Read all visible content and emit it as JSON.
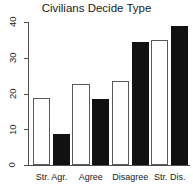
{
  "chart_data": {
    "type": "bar",
    "title": "Civilians Decide Type",
    "xlabel": "",
    "ylabel": "",
    "categories": [
      "Str. Agr.",
      "Agree",
      "Disagree",
      "Str. Dis."
    ],
    "series": [
      {
        "name": "open",
        "style": "white",
        "values": [
          18.7,
          22.8,
          23.6,
          35.0
        ]
      },
      {
        "name": "filled",
        "style": "black",
        "values": [
          8.7,
          18.4,
          34.3,
          38.8
        ]
      }
    ],
    "bars": [
      {
        "category": "Str. Agr.",
        "series": "open",
        "value": 18.7
      },
      {
        "category": "Str. Agr.",
        "series": "filled",
        "value": 8.7
      },
      {
        "category": "Agree",
        "series": "open",
        "value": 22.8
      },
      {
        "category": "Agree",
        "series": "filled",
        "value": 18.4
      },
      {
        "category": "Disagree",
        "series": "open",
        "value": 23.6
      },
      {
        "category": "Disagree",
        "series": "filled",
        "value": 34.3
      },
      {
        "category": "Str. Dis.",
        "series": "open",
        "value": 35.0
      },
      {
        "category": "Str. Dis.",
        "series": "filled",
        "value": 38.8
      }
    ],
    "yticks": [
      0,
      10,
      20,
      30,
      40
    ],
    "ytick_labels": [
      "0",
      "10",
      "20",
      "30",
      "40"
    ],
    "ylim": [
      0,
      40
    ],
    "grid": false,
    "legend": "none",
    "colors": {
      "open_fill": "#ffffff",
      "open_border": "#595959",
      "filled_fill": "#111111",
      "axis": "#4d4d4d",
      "text": "#1a1a1a",
      "background": "#ffffff"
    }
  }
}
